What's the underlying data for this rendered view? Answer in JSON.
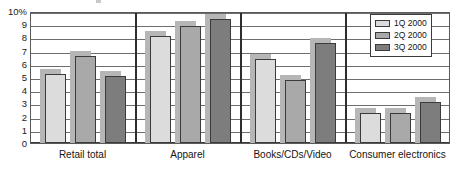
{
  "chart_data": {
    "type": "bar",
    "title": "",
    "subtitle": "",
    "xlabel": "",
    "ylabel": "",
    "ylim": [
      0,
      10
    ],
    "grid": true,
    "legend_position": "top-right",
    "unit": "%",
    "categories": [
      "Retail total",
      "Apparel",
      "Books/CDs/Video",
      "Consumer electronics"
    ],
    "tick_labels": [
      "10%",
      "9",
      "8",
      "7",
      "6",
      "5",
      "4",
      "3",
      "2",
      "1",
      "0"
    ],
    "tick_values": [
      10,
      9,
      8,
      7,
      6,
      5,
      4,
      3,
      2,
      1,
      0
    ],
    "series": [
      {
        "name": "1Q 2000",
        "color": "#dcdcdc",
        "values": [
          5.25,
          8.1,
          6.4,
          2.3
        ]
      },
      {
        "name": "2Q 2000",
        "color": "#a9a9a9",
        "values": [
          6.6,
          8.9,
          4.8,
          2.3
        ]
      },
      {
        "name": "3Q 2000",
        "color": "#7d7d7d",
        "values": [
          5.1,
          9.4,
          7.6,
          3.1
        ]
      }
    ]
  },
  "legend": {
    "items": [
      {
        "label": "1Q 2000"
      },
      {
        "label": "2Q 2000"
      },
      {
        "label": "3Q 2000"
      }
    ]
  },
  "axis": {
    "y_top_label": "10%",
    "y_labels": [
      "10%",
      "9",
      "8",
      "7",
      "6",
      "5",
      "4",
      "3",
      "2",
      "1",
      "0"
    ]
  }
}
